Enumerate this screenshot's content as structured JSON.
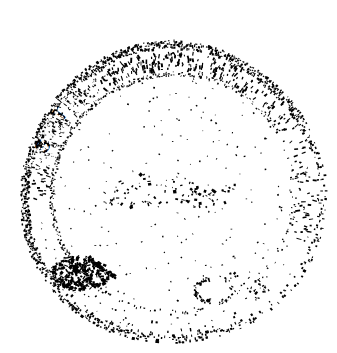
{
  "image": {
    "kind": "scanned-circular-seal",
    "width": 337,
    "height": 353,
    "background_color": "#ffffff",
    "ink_color": "#000000",
    "condition": "heavily degraded 1-bit scan, ink broken into speckles",
    "alt_text": "Faint black-and-white scan of a circular official seal or rubber stamp, mostly illegible"
  },
  "seal": {
    "center_x": 172,
    "center_y": 193,
    "outer_ring": {
      "radius": 148,
      "stroke_width": 5,
      "darkest_arc_degrees": [
        185,
        355
      ],
      "faintest_arc_degrees": [
        355,
        110
      ]
    },
    "inner_ring": {
      "radius": 120,
      "stroke_width": 3,
      "style": "dashed-broken"
    },
    "legible_text": "ST",
    "legible_text_position": "upper-left arc",
    "illegible_text_note": "remaining circumferential lettering is not readable",
    "center_mark_note": "faint scattered ink marks across the middle",
    "blotch_note": "dense ink blotch at lower-left",
    "bottom_glyph_note": "partial C-shaped glyph near lower-center-right"
  },
  "render": {
    "speckle_seed": 20240917,
    "ring_speckle_count": 1600,
    "field_speckle_count": 260,
    "text_speckle_count": 520
  }
}
